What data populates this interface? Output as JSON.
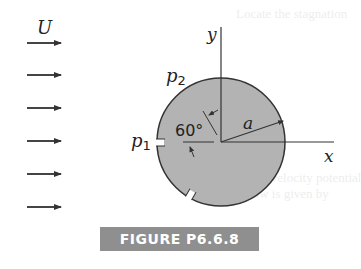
{
  "figure": {
    "caption": "FIGURE P6.6.8",
    "flow_label": "U",
    "axis_x_label": "x",
    "axis_y_label": "y",
    "radius_label": "a",
    "angle_label": "60°",
    "port1_label": "p",
    "port1_sub": "1",
    "port2_label": "p",
    "port2_sub": "2",
    "flow_arrow_count": 6
  },
  "colors": {
    "cylinder_fill": "#b3b3b3",
    "outline": "#333333",
    "caption_bg": "#8f8f8f",
    "caption_text": "#ffffff"
  },
  "bleed_through": {
    "line1": "Locate the stagnation",
    "line2": "in Fig. P6.6.8 the velocity potential",
    "line3": "potential flow is given by"
  }
}
